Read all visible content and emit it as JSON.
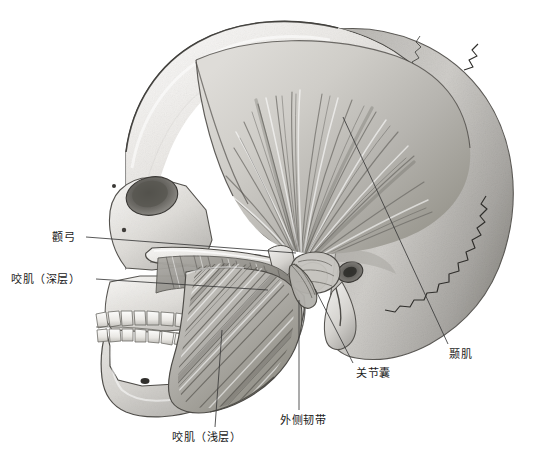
{
  "figure": {
    "view": "lateral",
    "background_color": "#ffffff",
    "ink_color": "#1a1a1a",
    "bone_light": "#f2f1ef",
    "bone_mid": "#c9c7c3",
    "bone_dark": "#8d8b87",
    "muscle_light": "#e8e7e4",
    "muscle_dark": "#6e6c68",
    "leader_color": "#3a3a3a"
  },
  "labels": [
    {
      "id": "zygomatic-arch",
      "text": "颧弓",
      "x": 52,
      "y": 231,
      "leader": {
        "x1": 86,
        "y1": 237,
        "x2": 296,
        "y2": 253
      }
    },
    {
      "id": "masseter-deep",
      "text": "咬肌（深层）",
      "x": 11,
      "y": 273,
      "leader": {
        "x1": 96,
        "y1": 279,
        "x2": 268,
        "y2": 290
      }
    },
    {
      "id": "masseter-superficial",
      "text": "咬肌（浅层）",
      "x": 172,
      "y": 431,
      "leader": {
        "x1": 215,
        "y1": 427,
        "x2": 222,
        "y2": 330
      }
    },
    {
      "id": "lateral-ligament",
      "text": "外侧韧带",
      "x": 280,
      "y": 414,
      "leader": {
        "x1": 299,
        "y1": 410,
        "x2": 299,
        "y2": 300
      }
    },
    {
      "id": "joint-capsule",
      "text": "关节囊",
      "x": 356,
      "y": 367,
      "leader": {
        "x1": 353,
        "y1": 363,
        "x2": 315,
        "y2": 289
      }
    },
    {
      "id": "temporalis",
      "text": "颞肌",
      "x": 449,
      "y": 348,
      "leader": {
        "x1": 448,
        "y1": 344,
        "x2": 343,
        "y2": 117
      }
    }
  ]
}
